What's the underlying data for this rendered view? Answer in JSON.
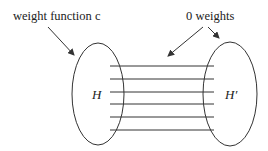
{
  "diagram": {
    "labels": {
      "left_annotation": "weight function c",
      "right_annotation": "0 weights",
      "left_set": "H",
      "right_set": "H′"
    },
    "colors": {
      "stroke": "#333333",
      "text": "#222222",
      "background": "#ffffff"
    },
    "edge_count": 6
  }
}
